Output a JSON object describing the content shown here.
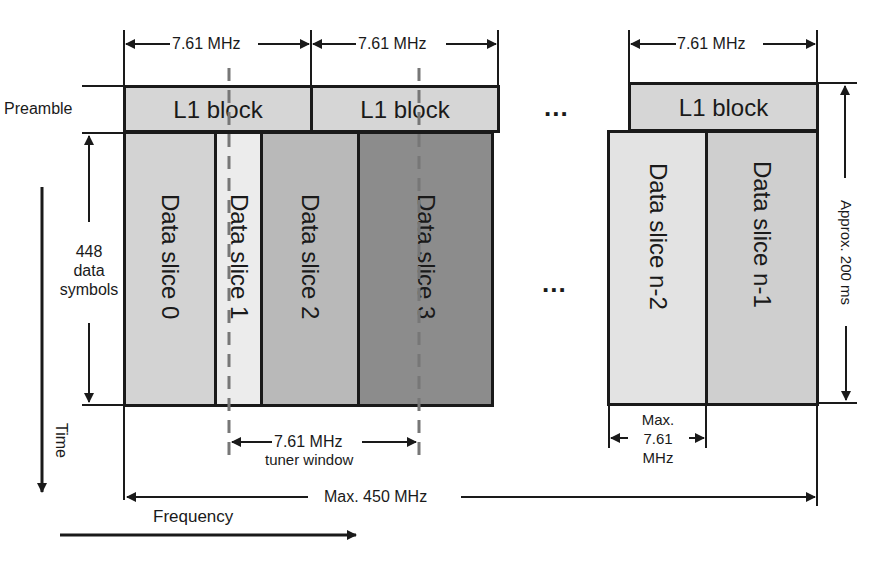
{
  "diagram": {
    "row_labels": {
      "preamble": "Preamble",
      "data_symbols": "448\ndata\nsymbols",
      "data_symbols_lines": [
        "448",
        "data",
        "symbols"
      ]
    },
    "axes": {
      "time": "Time",
      "frequency": "Frequency"
    },
    "dimensions": {
      "l1_width_1": "7.61 MHz",
      "l1_width_2": "7.61 MHz",
      "l1_width_3": "7.61 MHz",
      "tuner_window_value": "7.61 MHz",
      "tuner_window_label": "tuner window",
      "max_slice_lines": [
        "Max.",
        "7.61",
        "MHz"
      ],
      "max_total": "Max. 450 MHz",
      "duration": "Approx. 200 ms"
    },
    "l1_blocks": [
      {
        "label": "L1 block"
      },
      {
        "label": "L1 block"
      },
      {
        "label": "L1 block"
      }
    ],
    "ellipsis": "...",
    "data_slices": [
      {
        "label": "Data slice 0",
        "color": "#d3d3d3"
      },
      {
        "label": "Data slice 1",
        "color": "#ececec"
      },
      {
        "label": "Data slice 2",
        "color": "#b9b9b9"
      },
      {
        "label": "Data slice 3",
        "color": "#8c8c8c"
      },
      {
        "label": "Data slice n-2",
        "color": "#e3e3e3"
      },
      {
        "label": "Data slice n-1",
        "color": "#cfcfcf"
      }
    ],
    "colors": {
      "l1_block": "#d6d6d6",
      "outline": "#1a1a1a",
      "dashed_marker": "#777777"
    }
  }
}
